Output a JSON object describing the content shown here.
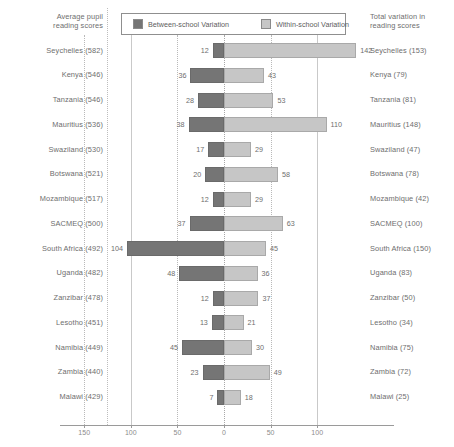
{
  "header": {
    "left_title": "Average pupil\nreading scores",
    "right_title": "Total variation in\nreading scores"
  },
  "legend": {
    "items": [
      {
        "label": "Between-school Variation",
        "color": "#757575"
      },
      {
        "label": "Within-school Variation",
        "color": "#c6c6c6"
      }
    ]
  },
  "axis": {
    "ticks": [
      {
        "label": "150",
        "value": -150
      },
      {
        "label": "100",
        "value": -100
      },
      {
        "label": "50",
        "value": -50
      },
      {
        "label": "0",
        "value": 0
      },
      {
        "label": "50",
        "value": 50
      },
      {
        "label": "100",
        "value": 100
      }
    ]
  },
  "chart_data": {
    "type": "bar",
    "title": "",
    "subtitle": "",
    "xlabel": "",
    "ylabel": "",
    "orientation": "horizontal",
    "stacked": "diverging",
    "xlim": [
      -150,
      150
    ],
    "grid": true,
    "legend_position": "top-center",
    "categories": [
      "Seychelles (582)",
      "Kenya (546)",
      "Tanzania (546)",
      "Mauritius (536)",
      "Swaziland (530)",
      "Botswana (521)",
      "Mozambique (517)",
      "SACMEQ (500)",
      "South Africa (492)",
      "Uganda (482)",
      "Zanzibar (478)",
      "Lesotho (451)",
      "Namibia (449)",
      "Zambia (440)",
      "Malawi (429)"
    ],
    "right_labels": [
      "Seychelles (153)",
      "Kenya (79)",
      "Tanzania (81)",
      "Mauritius (148)",
      "Swaziland (47)",
      "Botswana (78)",
      "Mozambique (42)",
      "SACMEQ (100)",
      "South Africa (150)",
      "Uganda (83)",
      "Zanzibar (50)",
      "Lesotho (34)",
      "Namibia (75)",
      "Zambia (72)",
      "Malawi (25)"
    ],
    "series": [
      {
        "name": "Between-school Variation",
        "direction": "left",
        "values": [
          12,
          36,
          28,
          38,
          17,
          20,
          12,
          37,
          104,
          48,
          12,
          13,
          45,
          23,
          7
        ]
      },
      {
        "name": "Within-school Variation",
        "direction": "right",
        "values": [
          142,
          43,
          53,
          110,
          29,
          58,
          29,
          63,
          45,
          36,
          37,
          21,
          30,
          49,
          18
        ]
      }
    ],
    "rows": [
      {
        "left_label": "Seychelles (582)",
        "between": 12,
        "within": 142,
        "right_label": "Seychelles (153)",
        "total": 153
      },
      {
        "left_label": "Kenya (546)",
        "between": 36,
        "within": 43,
        "right_label": "Kenya (79)",
        "total": 79
      },
      {
        "left_label": "Tanzania (546)",
        "between": 28,
        "within": 53,
        "right_label": "Tanzania (81)",
        "total": 81
      },
      {
        "left_label": "Mauritius (536)",
        "between": 38,
        "within": 110,
        "right_label": "Mauritius (148)",
        "total": 148
      },
      {
        "left_label": "Swaziland (530)",
        "between": 17,
        "within": 29,
        "right_label": "Swaziland (47)",
        "total": 47
      },
      {
        "left_label": "Botswana (521)",
        "between": 20,
        "within": 58,
        "right_label": "Botswana (78)",
        "total": 78
      },
      {
        "left_label": "Mozambique (517)",
        "between": 12,
        "within": 29,
        "right_label": "Mozambique (42)",
        "total": 42
      },
      {
        "left_label": "SACMEQ (500)",
        "between": 37,
        "within": 63,
        "right_label": "SACMEQ (100)",
        "total": 100
      },
      {
        "left_label": "South Africa (492)",
        "between": 104,
        "within": 45,
        "right_label": "South Africa (150)",
        "total": 150
      },
      {
        "left_label": "Uganda (482)",
        "between": 48,
        "within": 36,
        "right_label": "Uganda (83)",
        "total": 83
      },
      {
        "left_label": "Zanzibar (478)",
        "between": 12,
        "within": 37,
        "right_label": "Zanzibar (50)",
        "total": 50
      },
      {
        "left_label": "Lesotho (451)",
        "between": 13,
        "within": 21,
        "right_label": "Lesotho (34)",
        "total": 34
      },
      {
        "left_label": "Namibia (449)",
        "between": 45,
        "within": 30,
        "right_label": "Namibia (75)",
        "total": 75
      },
      {
        "left_label": "Zambia (440)",
        "between": 23,
        "within": 49,
        "right_label": "Zambia (72)",
        "total": 72
      },
      {
        "left_label": "Malawi (429)",
        "between": 7,
        "within": 18,
        "right_label": "Malawi (25)",
        "total": 25
      }
    ]
  }
}
